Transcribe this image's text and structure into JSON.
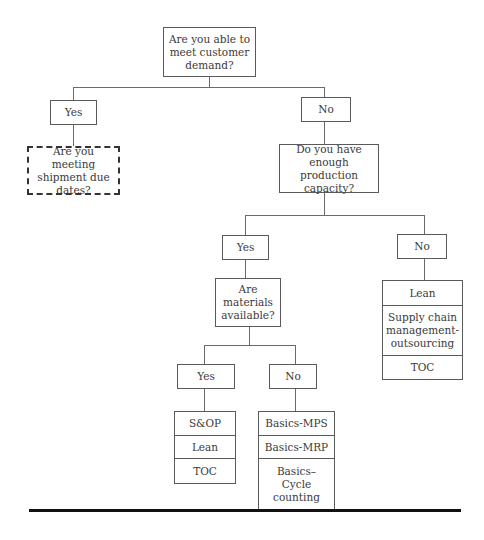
{
  "diagram": {
    "root": {
      "label": "Are you able to meet customer demand?"
    },
    "root_yes": {
      "label": "Yes"
    },
    "root_yes_question": {
      "label": "Are you meeting shipment due dates?"
    },
    "root_no": {
      "label": "No"
    },
    "capacity_question": {
      "label": "Do you have enough production capacity?"
    },
    "capacity_yes": {
      "label": "Yes"
    },
    "capacity_no": {
      "label": "No"
    },
    "capacity_no_tools": [
      "Lean",
      "Supply chain management-outsourcing",
      "TOC"
    ],
    "materials_question": {
      "label": "Are materials available?"
    },
    "materials_yes": {
      "label": "Yes"
    },
    "materials_no": {
      "label": "No"
    },
    "materials_yes_tools": [
      "S&OP",
      "Lean",
      "TOC"
    ],
    "materials_no_tools": [
      "Basics-MPS",
      "Basics-MRP",
      "Basics–Cycle counting"
    ]
  }
}
